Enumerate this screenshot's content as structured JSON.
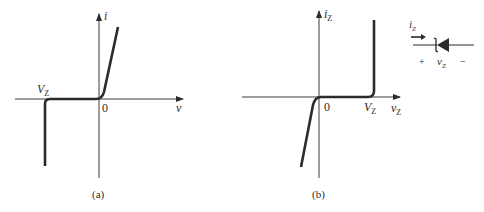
{
  "figure": {
    "panel_a": {
      "caption": "(a)",
      "y_axis_label": "i",
      "x_axis_label": "v",
      "origin_label": "0",
      "breakdown_label": {
        "main": "V",
        "sub": "Z"
      }
    },
    "panel_b": {
      "caption": "(b)",
      "y_axis_label": {
        "main": "i",
        "sub": "Z"
      },
      "x_axis_label": {
        "main": "v",
        "sub": "Z"
      },
      "origin_label": "0",
      "breakdown_label": {
        "main": "V",
        "sub": "Z"
      }
    },
    "diode_symbol": {
      "current_label": {
        "main": "i",
        "sub": "Z"
      },
      "voltage_label": {
        "main": "v",
        "sub": "Z"
      },
      "plus": "+",
      "minus": "−"
    },
    "colors": {
      "axis": "#3a3a3a",
      "curve": "#2b2b2b",
      "text": "#2a2a2a",
      "background": "#ffffff"
    }
  }
}
